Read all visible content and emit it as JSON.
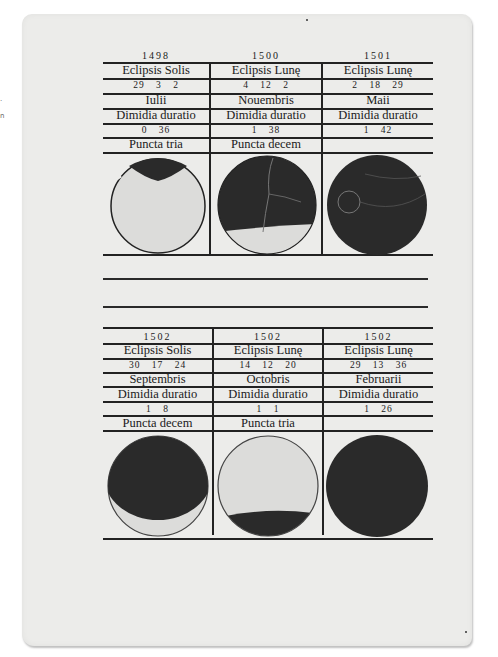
{
  "page": {
    "background": "#ececea",
    "ink": "#1a1a1a"
  },
  "upper_table": {
    "columns": [
      {
        "year": "1498",
        "type": "Eclipsis Solis",
        "time": "29 3 2",
        "month": "Iulii",
        "duration_label": "Dimidia duratio",
        "duration": "0 36",
        "magnitude": "Puncta tria",
        "diagram": "solar-partial-top-dark"
      },
      {
        "year": "1500",
        "type": "Eclipsis Lunę",
        "time": "4 12 2",
        "month": "Nouembris",
        "duration_label": "Dimidia duratio",
        "duration": "1 38",
        "magnitude": "Puncta decem",
        "diagram": "lunar-mostly-dark-bottom-light"
      },
      {
        "year": "1501",
        "type": "Eclipsis Lunę",
        "time": "2 18 29",
        "month": "Maii",
        "duration_label": "Dimidia duratio",
        "duration": "1 42",
        "magnitude": "",
        "diagram": "lunar-total-dark"
      }
    ]
  },
  "lower_table": {
    "columns": [
      {
        "year": "1502",
        "type": "Eclipsis Solis",
        "time": "30 17 24",
        "month": "Septembris",
        "duration_label": "Dimidia duratio",
        "duration": "1 8",
        "magnitude": "Puncta decem",
        "diagram": "solar-mostly-dark-bottom-crescent"
      },
      {
        "year": "1502",
        "type": "Eclipsis Lunę",
        "time": "14 12 20",
        "month": "Octobris",
        "duration_label": "Dimidia duratio",
        "duration": "1 1",
        "magnitude": "Puncta tria",
        "diagram": "lunar-partial-bottom-dark"
      },
      {
        "year": "1502",
        "type": "Eclipsis Lunę",
        "time": "29 13 36",
        "month": "Februarii",
        "duration_label": "Dimidia duratio",
        "duration": "1 26",
        "magnitude": "",
        "diagram": "lunar-total-dark"
      }
    ]
  }
}
